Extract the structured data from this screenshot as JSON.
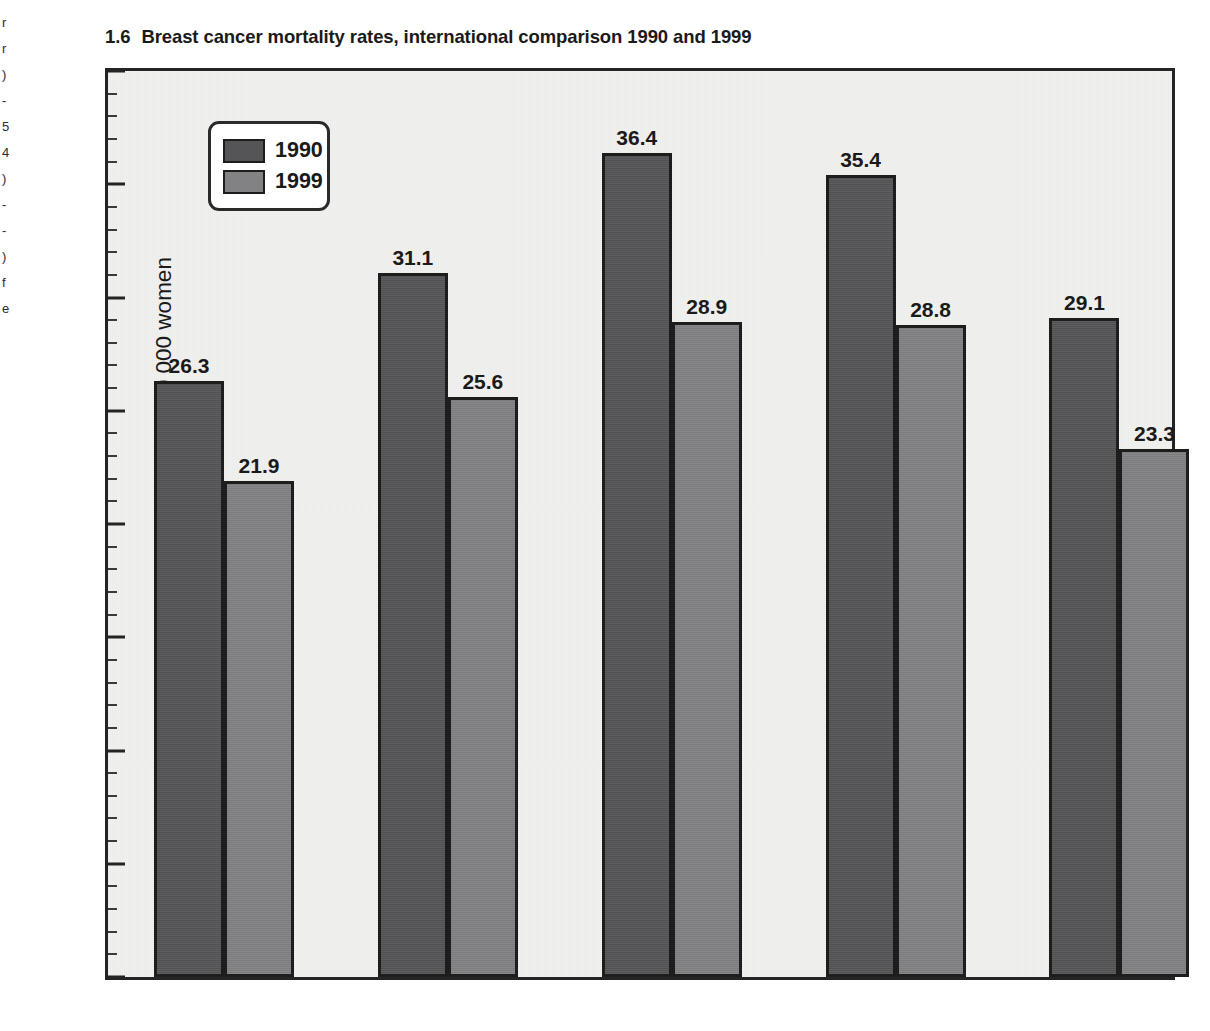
{
  "figure": {
    "number": "1.6",
    "title": "Breast cancer mortality rates, international comparison 1990 and 1999"
  },
  "page_bleed": {
    "glyphs": "r\nr\n)\n-\n5\n4\n)\n-\n-\n)\nf\ne"
  },
  "colors": {
    "series_1990": "#555558",
    "series_1999": "#828285",
    "bar_outline": "#1d1d1d",
    "plot_background": "#f1f1ef",
    "axis": "#242424",
    "text": "#1a1a1a"
  },
  "legend": {
    "position": "inside-top-left",
    "entries": [
      {
        "label": "1990",
        "color": "#555558"
      },
      {
        "label": "1999",
        "color": "#828285"
      }
    ]
  },
  "chart_data": {
    "type": "bar",
    "title": "Breast cancer mortality rates, international comparison 1990 and 1999",
    "xlabel": "",
    "ylabel": "Number of deaths from breast cancer per 100 000 women",
    "categories": [
      "Australia",
      "Canada",
      "England",
      "New Zealand",
      "United States"
    ],
    "series": [
      {
        "name": "1990",
        "color": "#555558",
        "values": [
          26.3,
          31.1,
          36.4,
          35.4,
          29.1
        ]
      },
      {
        "name": "1999",
        "color": "#828285",
        "values": [
          21.9,
          25.6,
          28.9,
          28.8,
          23.3
        ]
      }
    ],
    "ylim": [
      0,
      40
    ],
    "y_ticks": [
      0,
      5,
      10,
      15,
      20,
      25,
      30,
      35,
      40
    ],
    "y_tick_labels": [
      "0",
      "5",
      "10",
      "15",
      "20",
      "25",
      "30",
      "35",
      "40"
    ],
    "y_minor_tick_interval": 1,
    "grid": false,
    "data_labels": true,
    "legend_position": "upper left"
  }
}
